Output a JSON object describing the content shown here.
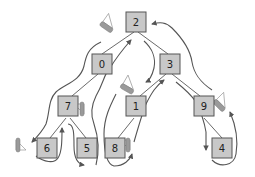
{
  "diagram": {
    "type": "binary-tree-traversal",
    "nodes": [
      {
        "id": "n2",
        "label": "2"
      },
      {
        "id": "n0",
        "label": "0"
      },
      {
        "id": "n3",
        "label": "3"
      },
      {
        "id": "n7",
        "label": "7"
      },
      {
        "id": "n1",
        "label": "1"
      },
      {
        "id": "n9",
        "label": "9"
      },
      {
        "id": "n6",
        "label": "6"
      },
      {
        "id": "n5",
        "label": "5"
      },
      {
        "id": "n8",
        "label": "8"
      },
      {
        "id": "n4",
        "label": "4"
      }
    ],
    "edges": [
      [
        "2",
        "0"
      ],
      [
        "2",
        "3"
      ],
      [
        "0",
        "7"
      ],
      [
        "3",
        "1"
      ],
      [
        "3",
        "9"
      ],
      [
        "7",
        "6"
      ],
      [
        "7",
        "5"
      ],
      [
        "1",
        "8"
      ],
      [
        "9",
        "4"
      ]
    ],
    "markers": [
      "sailboat-2",
      "sailboat-3",
      "sailboat-7",
      "sailboat-6",
      "sailboat-8",
      "sailboat-9"
    ],
    "colors": {
      "node_fill": "#c8c8c8",
      "node_stroke": "#555555",
      "path_stroke": "#555555"
    }
  }
}
